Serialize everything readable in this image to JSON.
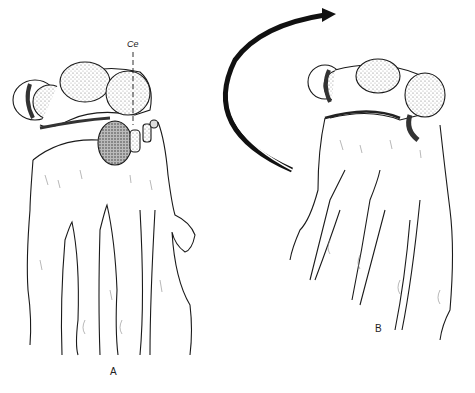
{
  "figure": {
    "panels": [
      {
        "id": "A",
        "label": "A",
        "annotation": "Ce"
      },
      {
        "id": "B",
        "label": "B"
      }
    ],
    "arrow": {
      "direction": "clockwise-rotation",
      "color": "#111111"
    },
    "colors": {
      "line": "#1a1a1a",
      "stipple_dark": "#555555",
      "stipple_light": "#bbbbbb",
      "background": "#ffffff"
    }
  }
}
